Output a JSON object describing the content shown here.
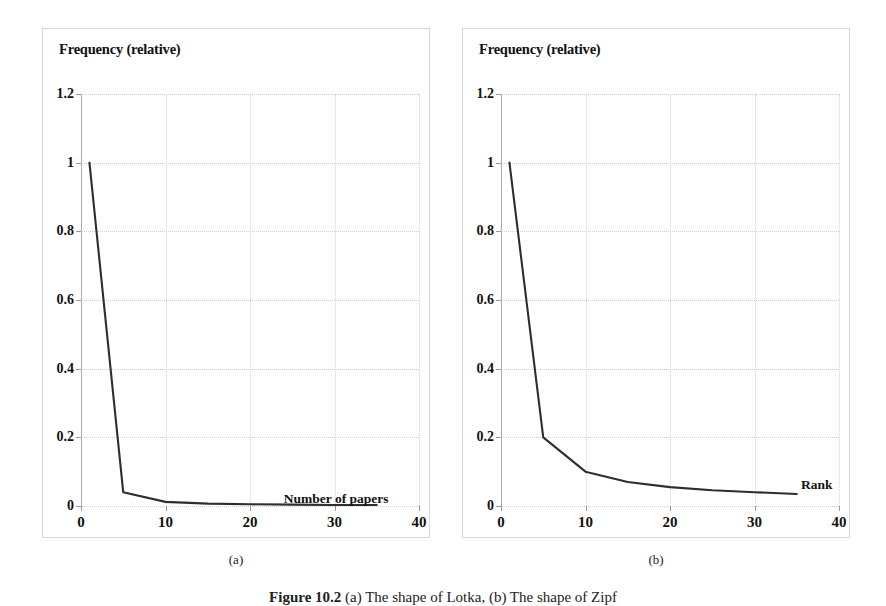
{
  "figure": {
    "caption_prefix": "Figure 10.2",
    "caption_text": " (a) The shape of Lotka, (b) The shape of Zipf"
  },
  "panels": [
    {
      "key": "a",
      "subcaption": "(a)",
      "ylabel": "Frequency (relative)",
      "xlabel": "Number of papers"
    },
    {
      "key": "b",
      "subcaption": "(b)",
      "ylabel": "Frequency (relative)",
      "xlabel": "Rank"
    }
  ],
  "axes": {
    "yticks": [
      "1.2",
      "1",
      "0.8",
      "0.6",
      "0.4",
      "0.2",
      "0"
    ],
    "xticks": [
      "0",
      "10",
      "20",
      "30",
      "40"
    ]
  },
  "style": {
    "line_color": "#2e2e2e",
    "grid_color": "#cfcfcf",
    "axis_color": "#9a9a9a",
    "text_color": "#111111",
    "panel_border": "#d8d8d8"
  },
  "chart_data": [
    {
      "type": "line",
      "title": "(a) The shape of Lotka",
      "xlabel": "Number of papers",
      "ylabel": "Frequency (relative)",
      "xlim": [
        0,
        40
      ],
      "ylim": [
        0,
        1.2
      ],
      "xticks": [
        0,
        10,
        20,
        30,
        40
      ],
      "yticks": [
        0,
        0.2,
        0.4,
        0.6,
        0.8,
        1,
        1.2
      ],
      "grid": true,
      "legend": "none",
      "x": [
        1,
        5,
        10,
        15,
        20,
        25,
        30,
        35
      ],
      "y": [
        1.0,
        0.04,
        0.012,
        0.007,
        0.005,
        0.004,
        0.003,
        0.003
      ]
    },
    {
      "type": "line",
      "title": "(b) The shape of Zipf",
      "xlabel": "Rank",
      "ylabel": "Frequency (relative)",
      "xlim": [
        0,
        40
      ],
      "ylim": [
        0,
        1.2
      ],
      "xticks": [
        0,
        10,
        20,
        30,
        40
      ],
      "yticks": [
        0,
        0.2,
        0.4,
        0.6,
        0.8,
        1,
        1.2
      ],
      "grid": true,
      "legend": "none",
      "x": [
        1,
        5,
        10,
        15,
        20,
        25,
        30,
        35
      ],
      "y": [
        1.0,
        0.2,
        0.1,
        0.07,
        0.055,
        0.046,
        0.04,
        0.035
      ]
    }
  ]
}
